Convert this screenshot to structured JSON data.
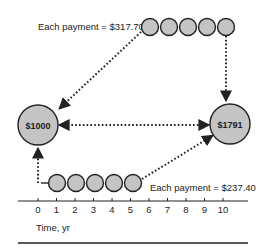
{
  "diagram": {
    "present_value": {
      "label": "$1000"
    },
    "future_value": {
      "label": "$1791"
    },
    "top_series": {
      "label": "Each payment = $317.70",
      "count": 5
    },
    "bottom_series": {
      "label": "Each payment = $237.40",
      "count": 5
    },
    "axis": {
      "ticks": [
        "0",
        "1",
        "2",
        "3",
        "4",
        "5",
        "6",
        "7",
        "8",
        "9",
        "10"
      ],
      "label": "Time, yr"
    },
    "colors": {
      "circle_fill": "#c4c4c4",
      "stroke": "#222222",
      "background": "#ffffff"
    }
  }
}
